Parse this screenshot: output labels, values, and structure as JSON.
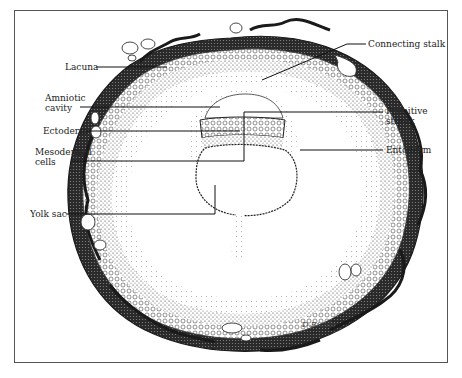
{
  "figure": {
    "signature": "D.Ricolo",
    "colors": {
      "ink": "#222222",
      "frame": "#555555",
      "background": "#ffffff"
    }
  },
  "labels": {
    "lacuna": "Lacuna",
    "amniotic_cavity_1": "Amniotic",
    "amniotic_cavity_2": "cavity",
    "ectoderm": "Ectoderm",
    "mesodermal_cells_1": "Mesodermal",
    "mesodermal_cells_2": "cells",
    "yolk_sac": "Yolk sac",
    "connecting_stalk": "Connecting stalk",
    "primitive_streak_1": "Primitive",
    "primitive_streak_2": "streak",
    "entoderm": "Entoderm"
  }
}
